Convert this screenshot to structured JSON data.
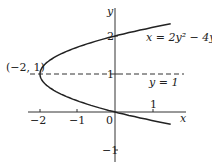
{
  "chart_data": {
    "type": "line",
    "title": "",
    "xlabel": "x",
    "ylabel": "y",
    "xlim": [
      -2.5,
      2
    ],
    "ylim": [
      -1.2,
      2.5
    ],
    "x_ticks": [
      "-2",
      "-1",
      "0",
      "1"
    ],
    "y_ticks": [
      "2",
      "1",
      "-1"
    ],
    "curve": {
      "equation": "x = 2y² − 4y",
      "y_range": [
        -0.32,
        2.32
      ]
    },
    "asymptote_line": {
      "equation": "y = 1",
      "style": "dashed"
    },
    "annotations": [
      {
        "text": "(−2, 1)",
        "x": -2,
        "y": 1
      }
    ],
    "grid": false
  },
  "labels": {
    "y_axis": "y",
    "x_axis": "x",
    "tick_2": "2",
    "tick_y1": "1",
    "tick_ym1": "−1",
    "tick_xm2": "−2",
    "tick_xm1": "−1",
    "tick_0": "0",
    "tick_x1": "1",
    "curve_eq": "x = 2y² − 4y",
    "line_eq": "y = 1",
    "vertex": "(−2, 1)"
  }
}
